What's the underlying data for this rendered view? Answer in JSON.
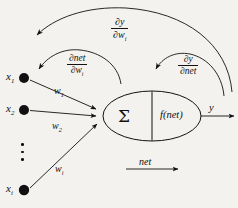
{
  "figure": {
    "background_color": "#f4f2ee",
    "ink_color": "#111111"
  },
  "inputs": [
    {
      "name": "x1",
      "label": "x",
      "subscript": "1"
    },
    {
      "name": "x2",
      "label": "x",
      "subscript": "2"
    },
    {
      "name": "xi",
      "label": "x",
      "subscript": "i"
    }
  ],
  "weights": [
    {
      "name": "w1",
      "label": "w",
      "subscript": "1"
    },
    {
      "name": "w2",
      "label": "w",
      "subscript": "2"
    },
    {
      "name": "wi",
      "label": "w",
      "subscript": "i"
    }
  ],
  "neuron": {
    "summation_symbol": "Σ",
    "activation_label": "f(net)",
    "net_label": "net"
  },
  "output": {
    "label": "y"
  },
  "derivatives": [
    {
      "name": "dy-dwi",
      "numerator": "∂y",
      "denominator": "∂w",
      "denominator_subscript": "i"
    },
    {
      "name": "dnet-dwi",
      "numerator": "∂net",
      "denominator": "∂w",
      "denominator_subscript": "i"
    },
    {
      "name": "dy-dnet",
      "numerator": "∂y",
      "denominator": "∂net",
      "denominator_subscript": ""
    }
  ],
  "ellipsis": {
    "label": "vertical-ellipsis",
    "dot_count": 3
  }
}
